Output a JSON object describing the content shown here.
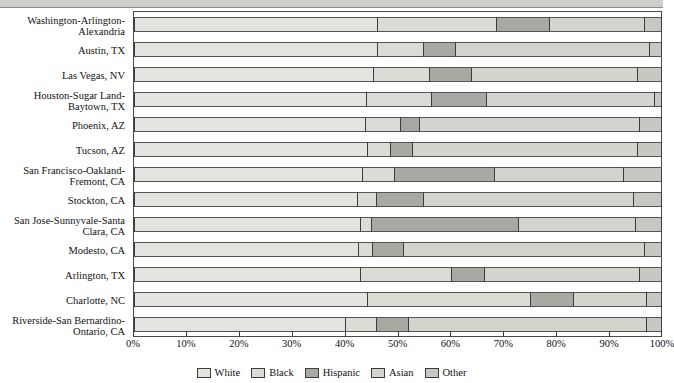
{
  "chart_data": {
    "type": "bar",
    "subtype": "horizontal-stacked-100-percent",
    "title": "",
    "xlabel": "",
    "ylabel": "",
    "xlim": [
      0,
      100
    ],
    "grid": false,
    "legend_position": "bottom-center",
    "categories": [
      "Washington-Arlington-Alexandria",
      "Austin, TX",
      "Las Vegas, NV",
      "Houston-Sugar Land-Baytown, TX",
      "Phoenix, AZ",
      "Tucson, AZ",
      "San Francisco-Oakland-Fremont, CA",
      "Stockton, CA",
      "San Jose-Sunnyvale-Santa Clara, CA",
      "Modesto, CA",
      "Arlington, TX",
      "Charlotte, NC",
      "Riverside-San Bernardino-Ontario, CA"
    ],
    "category_label_lines": [
      [
        "Washington-Arlington-",
        "Alexandria"
      ],
      [
        "Austin, TX"
      ],
      [
        "Las Vegas, NV"
      ],
      [
        "Houston-Sugar Land-",
        "Baytown, TX"
      ],
      [
        "Phoenix, AZ"
      ],
      [
        "Tucson, AZ"
      ],
      [
        "San Francisco-Oakland-",
        "Fremont, CA"
      ],
      [
        "Stockton, CA"
      ],
      [
        "San Jose-Sunnyvale-Santa",
        "Clara, CA"
      ],
      [
        "Modesto, CA"
      ],
      [
        "Arlington, TX"
      ],
      [
        "Charlotte, NC"
      ],
      [
        "Riverside-San Bernardino-",
        "Ontario, CA"
      ]
    ],
    "series": [
      {
        "name": "White",
        "color": "#e3e3df",
        "values": [
          46.3,
          46.3,
          45.5,
          44.2,
          44.0,
          44.4,
          43.3,
          42.5,
          42.9,
          42.7,
          42.9,
          44.4,
          40.1
        ]
      },
      {
        "name": "Black",
        "color": "#dcdcd7",
        "values": [
          22.5,
          8.7,
          10.6,
          12.3,
          6.6,
          4.2,
          6.2,
          3.6,
          2.1,
          2.5,
          17.4,
          30.8,
          5.9
        ]
      },
      {
        "name": "Hispanic",
        "color": "#a9a9a4",
        "values": [
          10.0,
          6.0,
          7.9,
          10.4,
          3.6,
          4.3,
          18.9,
          8.9,
          28.0,
          6.0,
          6.2,
          8.1,
          6.1
        ]
      },
      {
        "name": "Asian",
        "color": "#d4d4cf",
        "values": [
          18.0,
          36.7,
          31.5,
          31.7,
          41.6,
          42.6,
          24.4,
          39.7,
          22.1,
          45.6,
          29.3,
          13.8,
          45.1
        ]
      },
      {
        "name": "Other",
        "color": "#c8c8c3",
        "values": [
          3.2,
          2.3,
          4.5,
          1.4,
          4.2,
          4.5,
          7.2,
          5.3,
          4.9,
          3.2,
          4.2,
          2.9,
          2.8
        ]
      }
    ],
    "xticks": [
      {
        "value": 0,
        "label": "0%"
      },
      {
        "value": 10,
        "label": "10%"
      },
      {
        "value": 20,
        "label": "20%"
      },
      {
        "value": 30,
        "label": "30%"
      },
      {
        "value": 40,
        "label": "40%"
      },
      {
        "value": 50,
        "label": "50%"
      },
      {
        "value": 60,
        "label": "60%"
      },
      {
        "value": 70,
        "label": "70%"
      },
      {
        "value": 80,
        "label": "80%"
      },
      {
        "value": 90,
        "label": "90%"
      },
      {
        "value": 100,
        "label": "100%"
      }
    ],
    "legend": [
      {
        "label": "White",
        "color": "#e3e3df"
      },
      {
        "label": "Black",
        "color": "#dcdcd7"
      },
      {
        "label": "Hispanic",
        "color": "#a9a9a4"
      },
      {
        "label": "Asian",
        "color": "#d4d4cf"
      },
      {
        "label": "Other",
        "color": "#c8c8c3"
      }
    ]
  }
}
